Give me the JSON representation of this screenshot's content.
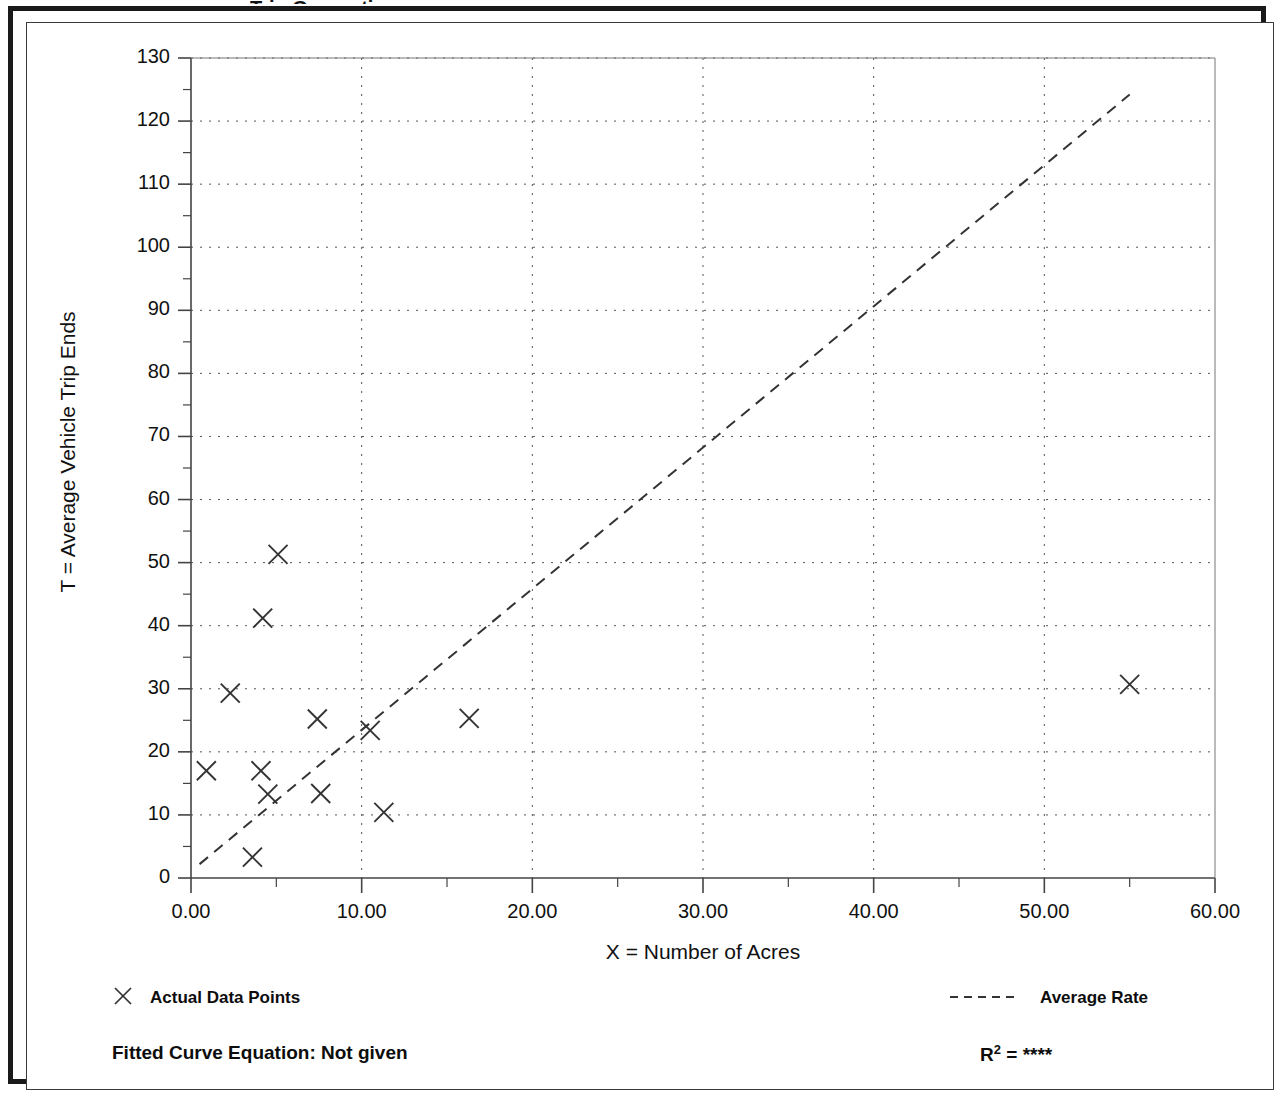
{
  "page": {
    "cut_off_title": "Trip Generation"
  },
  "chart_data": {
    "type": "scatter",
    "title": "",
    "xlabel": "X = Number of Acres",
    "ylabel": "T = Average Vehicle Trip Ends",
    "xlim": [
      0,
      60
    ],
    "ylim": [
      0,
      130
    ],
    "xticks": [
      0,
      10,
      20,
      30,
      40,
      50,
      60
    ],
    "xtick_labels": [
      "0.00",
      "10.00",
      "20.00",
      "30.00",
      "40.00",
      "50.00",
      "60.00"
    ],
    "yticks": [
      0,
      10,
      20,
      30,
      40,
      50,
      60,
      70,
      80,
      90,
      100,
      110,
      120,
      130
    ],
    "ytick_labels": [
      "0",
      "10",
      "20",
      "30",
      "40",
      "50",
      "60",
      "70",
      "80",
      "90",
      "100",
      "110",
      "120",
      "130"
    ],
    "x_minor_tick_step": 5,
    "y_minor_tick_step": 5,
    "grid": true,
    "grid_style": "dotted",
    "legend_position": "below-plot",
    "marker": "x",
    "series": [
      {
        "name": "Actual Data Points",
        "type": "scatter",
        "marker": "x",
        "color": "#333333",
        "points": [
          {
            "x": 0.9,
            "y": 17.0
          },
          {
            "x": 2.3,
            "y": 29.3
          },
          {
            "x": 3.6,
            "y": 3.3
          },
          {
            "x": 4.1,
            "y": 17.0
          },
          {
            "x": 4.2,
            "y": 41.2
          },
          {
            "x": 4.5,
            "y": 13.3
          },
          {
            "x": 5.1,
            "y": 51.3
          },
          {
            "x": 7.4,
            "y": 25.2
          },
          {
            "x": 7.6,
            "y": 13.4
          },
          {
            "x": 10.5,
            "y": 23.4
          },
          {
            "x": 11.3,
            "y": 10.4
          },
          {
            "x": 16.3,
            "y": 25.3
          },
          {
            "x": 55.0,
            "y": 30.7
          }
        ]
      },
      {
        "name": "Average Rate",
        "type": "line",
        "style": "dashed",
        "color": "#333333",
        "x": [
          0.5,
          55.0
        ],
        "y": [
          2.2,
          124.2
        ]
      }
    ]
  },
  "legend": {
    "actual_label": "Actual Data Points",
    "average_label": "Average Rate",
    "actual_marker_icon": "x-marker-icon",
    "average_line_icon": "dashed-line-icon"
  },
  "footer": {
    "fitted_equation": "Fitted Curve Equation:  Not given",
    "r_symbol": "R",
    "r_exponent": "2",
    "r_equals": " = ",
    "r_value": "****"
  }
}
